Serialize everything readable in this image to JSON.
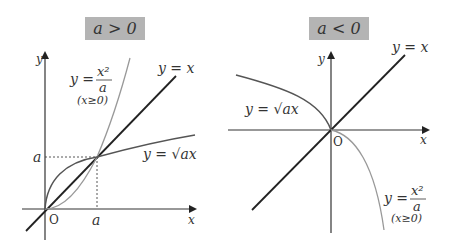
{
  "left_panel": {
    "title": "a > 0",
    "axis_y_label": "y",
    "axis_x_label": "x",
    "origin_label": "O",
    "tick_x_label": "a",
    "tick_y_label": "a",
    "curves": {
      "parabola": {
        "lhs": "y =",
        "num": "x²",
        "den": "a",
        "domain": "(x≥0)"
      },
      "line": {
        "label": "y = x"
      },
      "sqrt": {
        "label": "y = √ax"
      }
    }
  },
  "right_panel": {
    "title": "a < 0",
    "axis_y_label": "y",
    "axis_x_label": "x",
    "origin_label": "O",
    "curves": {
      "parabola": {
        "lhs": "y =",
        "num": "x²",
        "den": "a",
        "domain": "(x≥0)"
      },
      "line": {
        "label": "y = x"
      },
      "sqrt": {
        "label": "y = √ax"
      }
    }
  },
  "colors": {
    "title_box": "#b4b4b4",
    "axis": "#333333",
    "line": "#222222",
    "sqrt_curve": "#555555",
    "parabola_curve": "#999999"
  }
}
